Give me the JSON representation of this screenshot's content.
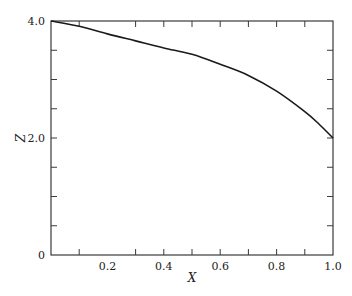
{
  "chart_data": {
    "type": "line",
    "title": "",
    "xlabel": "X",
    "ylabel": "Z",
    "xlim": [
      0,
      1.0
    ],
    "ylim": [
      0,
      4.0
    ],
    "grid": false,
    "legend": null,
    "x_tick_labels": [
      {
        "value": 0.2,
        "label": "0.2"
      },
      {
        "value": 0.4,
        "label": "0.4"
      },
      {
        "value": 0.6,
        "label": "0.6"
      },
      {
        "value": 0.8,
        "label": "0.8"
      },
      {
        "value": 1.0,
        "label": "1.0"
      }
    ],
    "x_minor_ticks": [
      0.1,
      0.3,
      0.4,
      0.5,
      0.6,
      0.7,
      0.8,
      0.9
    ],
    "y_tick_labels": [
      {
        "value": 0,
        "label": "0"
      },
      {
        "value": 2.0,
        "label": "2.0"
      },
      {
        "value": 4.0,
        "label": "4.0"
      }
    ],
    "y_minor_ticks": [
      0.5,
      1.0,
      1.5,
      2.0,
      2.5,
      3.0,
      3.5
    ],
    "series": [
      {
        "name": "Z(X)",
        "color": "#1a1a1a",
        "x": [
          0.0,
          0.1,
          0.2,
          0.3,
          0.4,
          0.5,
          0.6,
          0.7,
          0.8,
          0.9,
          0.95,
          1.0
        ],
        "values": [
          4.0,
          3.91,
          3.78,
          3.66,
          3.54,
          3.43,
          3.26,
          3.07,
          2.8,
          2.45,
          2.24,
          2.0
        ]
      }
    ]
  }
}
